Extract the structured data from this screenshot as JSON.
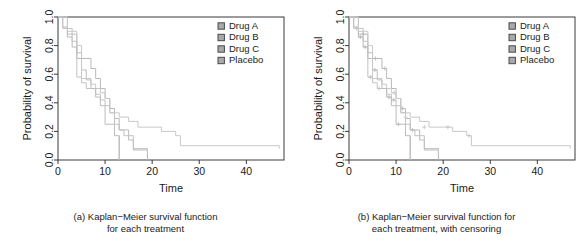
{
  "figure": {
    "panels": [
      {
        "id": "panel-a",
        "caption_line1": "(a) Kaplan−Meier survival function",
        "caption_line2": "for each treatment",
        "censoring": false
      },
      {
        "id": "panel-b",
        "caption_line1": "(b) Kaplan−Meier survival function for",
        "caption_line2": "each treatment, with censoring",
        "censoring": true
      }
    ]
  },
  "chart_data": [
    {
      "type": "line",
      "subtype": "kaplan-meier-step",
      "title": "",
      "xlabel": "Time",
      "ylabel": "Probability of survival",
      "xlim": [
        0,
        48
      ],
      "ylim": [
        0,
        1
      ],
      "xticks": [
        0,
        10,
        20,
        30,
        40
      ],
      "xticklabels": [
        "0",
        "10",
        "20",
        "30",
        "40"
      ],
      "yticks": [
        0.0,
        0.2,
        0.4,
        0.6,
        0.8,
        1.0
      ],
      "yticklabels": [
        "0.0",
        "0.2",
        "0.4",
        "0.6",
        "0.8",
        "1.0"
      ],
      "grid": false,
      "legend_position": "top-right",
      "legend_entries": [
        "Drug A",
        "Drug B",
        "Drug C",
        "Placebo"
      ],
      "series": [
        {
          "name": "Drug A",
          "color": "#b9b9b9",
          "x": [
            0,
            1,
            2,
            3,
            4,
            5,
            7,
            8,
            9,
            10,
            11,
            12,
            13,
            15,
            16,
            19
          ],
          "y": [
            1.0,
            0.93,
            0.86,
            0.79,
            0.71,
            0.71,
            0.64,
            0.57,
            0.5,
            0.43,
            0.36,
            0.29,
            0.21,
            0.14,
            0.07,
            0.0
          ]
        },
        {
          "name": "Drug B",
          "color": "#c2c2c2",
          "x": [
            0,
            1,
            3,
            4,
            5,
            6,
            8,
            9,
            10,
            11,
            12,
            13,
            14,
            16,
            19
          ],
          "y": [
            1.0,
            0.92,
            0.83,
            0.58,
            0.54,
            0.5,
            0.46,
            0.42,
            0.38,
            0.33,
            0.25,
            0.21,
            0.17,
            0.08,
            0.04
          ]
        },
        {
          "name": "Drug C",
          "color": "#bcbcbc",
          "x": [
            0,
            2,
            4,
            5,
            6,
            7,
            8,
            9,
            10,
            12,
            13
          ],
          "y": [
            1.0,
            0.88,
            0.75,
            0.63,
            0.56,
            0.5,
            0.44,
            0.38,
            0.25,
            0.17,
            0.0
          ]
        },
        {
          "name": "Placebo",
          "color": "#c8c8c8",
          "x": [
            0,
            2,
            4,
            5,
            7,
            8,
            9,
            10,
            11,
            13,
            15,
            17,
            20,
            22,
            25,
            26,
            47
          ],
          "y": [
            1.0,
            0.9,
            0.8,
            0.57,
            0.53,
            0.5,
            0.47,
            0.43,
            0.33,
            0.3,
            0.27,
            0.23,
            0.23,
            0.2,
            0.17,
            0.1,
            0.08
          ]
        }
      ],
      "censoring_marks": []
    },
    {
      "type": "line",
      "subtype": "kaplan-meier-step",
      "title": "",
      "xlabel": "Time",
      "ylabel": "Probability of survival",
      "xlim": [
        0,
        48
      ],
      "ylim": [
        0,
        1
      ],
      "xticks": [
        0,
        10,
        20,
        30,
        40
      ],
      "xticklabels": [
        "0",
        "10",
        "20",
        "30",
        "40"
      ],
      "yticks": [
        0.0,
        0.2,
        0.4,
        0.6,
        0.8,
        1.0
      ],
      "yticklabels": [
        "0.0",
        "0.2",
        "0.4",
        "0.6",
        "0.8",
        "1.0"
      ],
      "grid": false,
      "legend_position": "top-right",
      "legend_entries": [
        "Drug A",
        "Drug B",
        "Drug C",
        "Placebo"
      ],
      "series": [
        {
          "name": "Drug A",
          "color": "#b9b9b9",
          "x": [
            0,
            1,
            2,
            3,
            4,
            5,
            7,
            8,
            9,
            10,
            11,
            12,
            13,
            15,
            16,
            19
          ],
          "y": [
            1.0,
            0.93,
            0.86,
            0.79,
            0.71,
            0.71,
            0.64,
            0.57,
            0.5,
            0.43,
            0.36,
            0.29,
            0.21,
            0.14,
            0.07,
            0.0
          ]
        },
        {
          "name": "Drug B",
          "color": "#c2c2c2",
          "x": [
            0,
            1,
            3,
            4,
            5,
            6,
            8,
            9,
            10,
            11,
            12,
            13,
            14,
            16,
            19
          ],
          "y": [
            1.0,
            0.92,
            0.83,
            0.58,
            0.54,
            0.5,
            0.46,
            0.42,
            0.38,
            0.33,
            0.25,
            0.21,
            0.17,
            0.08,
            0.04
          ]
        },
        {
          "name": "Drug C",
          "color": "#bcbcbc",
          "x": [
            0,
            2,
            4,
            5,
            6,
            7,
            8,
            9,
            10,
            12,
            13
          ],
          "y": [
            1.0,
            0.88,
            0.75,
            0.63,
            0.56,
            0.5,
            0.44,
            0.38,
            0.25,
            0.17,
            0.0
          ]
        },
        {
          "name": "Placebo",
          "color": "#c8c8c8",
          "x": [
            0,
            2,
            4,
            5,
            7,
            8,
            9,
            10,
            11,
            13,
            15,
            17,
            20,
            22,
            25,
            26,
            47
          ],
          "y": [
            1.0,
            0.9,
            0.8,
            0.57,
            0.53,
            0.5,
            0.47,
            0.43,
            0.33,
            0.3,
            0.27,
            0.23,
            0.23,
            0.2,
            0.17,
            0.1,
            0.08
          ]
        }
      ],
      "censoring_marks": [
        {
          "series": "Drug A",
          "x": 2.4,
          "y": 0.86
        },
        {
          "series": "Drug A",
          "x": 3.4,
          "y": 0.79
        },
        {
          "series": "Drug A",
          "x": 5.6,
          "y": 0.71
        },
        {
          "series": "Drug A",
          "x": 7.6,
          "y": 0.64
        },
        {
          "series": "Drug A",
          "x": 11.4,
          "y": 0.36
        },
        {
          "series": "Drug B",
          "x": 1.6,
          "y": 0.92
        },
        {
          "series": "Drug B",
          "x": 4.6,
          "y": 0.58
        },
        {
          "series": "Drug B",
          "x": 6.4,
          "y": 0.5
        },
        {
          "series": "Drug B",
          "x": 9.5,
          "y": 0.42
        },
        {
          "series": "Drug B",
          "x": 13.5,
          "y": 0.21
        },
        {
          "series": "Drug C",
          "x": 3.0,
          "y": 0.88
        },
        {
          "series": "Drug C",
          "x": 5.5,
          "y": 0.63
        },
        {
          "series": "Drug C",
          "x": 8.5,
          "y": 0.44
        },
        {
          "series": "Drug C",
          "x": 10.5,
          "y": 0.25
        },
        {
          "series": "Placebo",
          "x": 9.6,
          "y": 0.47
        },
        {
          "series": "Placebo",
          "x": 12.0,
          "y": 0.3
        },
        {
          "series": "Placebo",
          "x": 16.0,
          "y": 0.23
        },
        {
          "series": "Placebo",
          "x": 21.0,
          "y": 0.23
        },
        {
          "series": "Placebo",
          "x": 25.5,
          "y": 0.17
        }
      ]
    }
  ],
  "style": {
    "axis_color": "#3a3a3a",
    "curve_color": "#bdbdbd",
    "legend_marker_fill": "#a9a9a9",
    "legend_marker_border": "#4a4a4a",
    "background": "#ffffff"
  }
}
